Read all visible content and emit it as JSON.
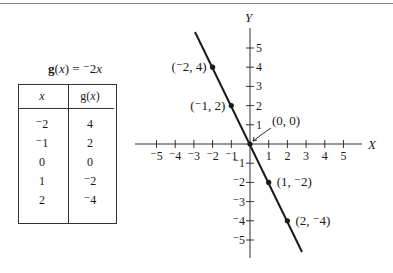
{
  "function_label": {
    "name": "g",
    "expression": "(x) = ⁻2x"
  },
  "table": {
    "headers": [
      "x",
      "g(x)"
    ],
    "rows": [
      {
        "x": "⁻2",
        "gx": "4"
      },
      {
        "x": "⁻1",
        "gx": "2"
      },
      {
        "x": "0",
        "gx": "0"
      },
      {
        "x": "1",
        "gx": "⁻2"
      },
      {
        "x": "2",
        "gx": "⁻4"
      }
    ]
  },
  "chart_data": {
    "type": "line",
    "xlabel": "X",
    "ylabel": "Y",
    "xlim": [
      -5,
      5
    ],
    "ylim": [
      -5,
      5
    ],
    "grid": false,
    "x_ticks": [
      "⁻5",
      "⁻4",
      "⁻3",
      "⁻2",
      "⁻1",
      "1",
      "2",
      "3",
      "4",
      "5"
    ],
    "y_ticks": [
      "5",
      "4",
      "3",
      "2",
      "1",
      "⁻1",
      "⁻2",
      "⁻3",
      "⁻4",
      "⁻5"
    ],
    "series": [
      {
        "name": "g(x) = -2x",
        "x": [
          -2,
          -1,
          0,
          1,
          2
        ],
        "y": [
          4,
          2,
          0,
          -2,
          -4
        ]
      }
    ],
    "point_labels": [
      {
        "label": "(⁻2, 4)",
        "x": -2,
        "y": 4
      },
      {
        "label": "(⁻1, 2)",
        "x": -1,
        "y": 2
      },
      {
        "label": "(0, 0)",
        "x": 0,
        "y": 0
      },
      {
        "label": "(1, ⁻2)",
        "x": 1,
        "y": -2
      },
      {
        "label": "(2, ⁻4)",
        "x": 2,
        "y": -4
      }
    ]
  }
}
